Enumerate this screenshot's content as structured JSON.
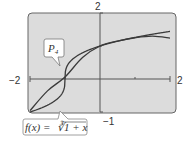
{
  "chart_data": {
    "type": "line",
    "title": "",
    "xlabel": "",
    "ylabel": "",
    "xlim": [
      -2,
      2
    ],
    "ylim": [
      -1,
      2
    ],
    "grid": false,
    "tick_labels": {
      "x_min": "−2",
      "x_max": "2",
      "y_max": "2",
      "y_min": "−1"
    },
    "x_ticks": [
      -1,
      1
    ],
    "y_ticks": [
      1
    ],
    "series": [
      {
        "name": "f(x) = ∛(1 + x)",
        "label_text": "f(x) = ∛1 + x",
        "x": [
          -2,
          -1.5,
          -1.2,
          -1.05,
          -1,
          -0.95,
          -0.8,
          -0.5,
          0,
          0.5,
          1,
          1.5,
          2
        ],
        "values": [
          -1,
          -0.79,
          -0.58,
          -0.37,
          0,
          0.37,
          0.58,
          0.79,
          1,
          1.14,
          1.26,
          1.36,
          1.44
        ]
      },
      {
        "name": "P4",
        "label_text": "P",
        "label_subscript": "4",
        "x": [
          -2,
          -1.5,
          -1,
          -0.5,
          0,
          0.5,
          1,
          1.5,
          2
        ],
        "values": [
          -0.96,
          -0.36,
          0.06,
          0.65,
          1,
          1.15,
          1.25,
          1.3,
          1.24
        ]
      }
    ],
    "annotations": [
      {
        "text": "P4",
        "target_series": "P4",
        "position": "upper-left"
      },
      {
        "text": "f(x) = ∛(1 + x)",
        "target_series": "f(x)",
        "position": "bottom-left"
      }
    ]
  },
  "colors": {
    "plot_bg": "#dcdcdc",
    "frame": "#555555",
    "curve": "#3a3a3a",
    "axis": "#555555",
    "label_box": "#ffffff"
  }
}
